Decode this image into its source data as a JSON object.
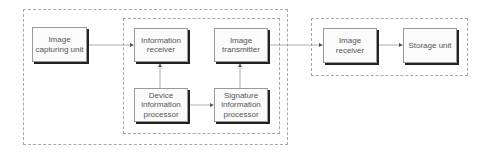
{
  "groups": {
    "outer": "dashed-group-outer",
    "inner": "dashed-group-inner",
    "right": "dashed-group-receiver"
  },
  "nodes": {
    "image_capturing_unit": "Image capturing unit",
    "information_receiver": "Information receiver",
    "image_transmitter": "Image transmitter",
    "device_information_processor": "Device information processor",
    "signature_information_processor": "Signature information processor",
    "image_receiver": "Image receiver",
    "storage_unit": "Storage unit"
  },
  "edges": [
    {
      "from": "Image capturing unit",
      "to": "Information receiver"
    },
    {
      "from": "Device information processor",
      "to": "Information receiver"
    },
    {
      "from": "Device information processor",
      "to": "Signature information processor"
    },
    {
      "from": "Signature information processor",
      "to": "Image transmitter"
    },
    {
      "from": "Image transmitter",
      "to": "Image receiver"
    },
    {
      "from": "Image receiver",
      "to": "Storage unit"
    }
  ],
  "colors": {
    "line": "#888888",
    "shadow": "#222222",
    "text": "#555555"
  }
}
